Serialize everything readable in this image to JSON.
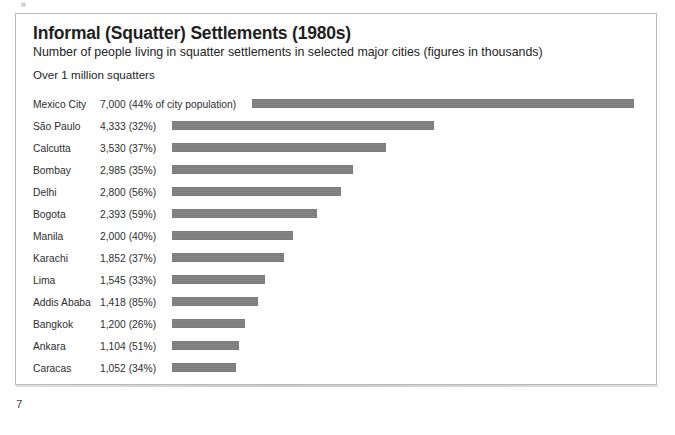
{
  "page": {
    "folio": "7"
  },
  "figure": {
    "title": "Informal (Squatter) Settlements (1980s)",
    "subtitle": "Number of people living in squatter settlements in selected major cities (figures in thousands)",
    "section_label": "Over 1 million squatters",
    "bar_color": "#7e7e7e",
    "border_color": "#b9b9b9"
  },
  "chart_data": {
    "type": "bar",
    "orientation": "horizontal",
    "title": "Informal (Squatter) Settlements (1980s)",
    "subtitle": "Number of people living in squatter settlements in selected major cities (figures in thousands)",
    "section_label": "Over 1 million squatters",
    "xlabel": "",
    "ylabel": "",
    "units": "thousands of people",
    "grid": false,
    "legend": "none",
    "xlim": [
      0,
      7000
    ],
    "categories": [
      "Mexico City",
      "São Paulo",
      "Calcutta",
      "Bombay",
      "Delhi",
      "Bogota",
      "Manila",
      "Karachi",
      "Lima",
      "Addis Ababa",
      "Bangkok",
      "Ankara",
      "Caracas"
    ],
    "values": [
      7000,
      4333,
      3530,
      2985,
      2800,
      2393,
      2000,
      1852,
      1545,
      1418,
      1200,
      1104,
      1052
    ],
    "percent_of_city_population": [
      44,
      32,
      37,
      35,
      56,
      59,
      40,
      37,
      33,
      85,
      26,
      51,
      34
    ],
    "rows": [
      {
        "city": "Mexico City",
        "value_label": "7,000 (44% of city population)",
        "value": 7000,
        "percent": 44
      },
      {
        "city": "São Paulo",
        "value_label": "4,333 (32%)",
        "value": 4333,
        "percent": 32
      },
      {
        "city": "Calcutta",
        "value_label": "3,530 (37%)",
        "value": 3530,
        "percent": 37
      },
      {
        "city": "Bombay",
        "value_label": "2,985 (35%)",
        "value": 2985,
        "percent": 35
      },
      {
        "city": "Delhi",
        "value_label": "2,800 (56%)",
        "value": 2800,
        "percent": 56
      },
      {
        "city": "Bogota",
        "value_label": "2,393 (59%)",
        "value": 2393,
        "percent": 59
      },
      {
        "city": "Manila",
        "value_label": "2,000 (40%)",
        "value": 2000,
        "percent": 40
      },
      {
        "city": "Karachi",
        "value_label": "1,852 (37%)",
        "value": 1852,
        "percent": 37
      },
      {
        "city": "Lima",
        "value_label": "1,545 (33%)",
        "value": 1545,
        "percent": 33
      },
      {
        "city": "Addis Ababa",
        "value_label": "1,418 (85%)",
        "value": 1418,
        "percent": 85
      },
      {
        "city": "Bangkok",
        "value_label": "1,200 (26%)",
        "value": 1200,
        "percent": 26
      },
      {
        "city": "Ankara",
        "value_label": "1,104 (51%)",
        "value": 1104,
        "percent": 51
      },
      {
        "city": "Caracas",
        "value_label": "1,052 (34%)",
        "value": 1052,
        "percent": 34
      }
    ]
  },
  "render": {
    "bar_start_x": 156,
    "bar_start_x_first_row": 236,
    "bar_end_x_first_row": 618,
    "px_per_unit": 0.0605
  }
}
